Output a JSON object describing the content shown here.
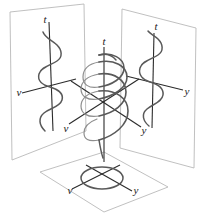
{
  "figure": {
    "background_color": "#ffffff",
    "plane_edge_color": "#b9b9b9",
    "curve_color": "#595959",
    "axis_color": "#2b2b2b",
    "label_color": "#1a1a1a",
    "width": 200,
    "height": 224
  },
  "planes": [
    {
      "id": "left-plane",
      "name": "v-t plane",
      "axes": {
        "vertical": "t",
        "horizontal": "v"
      },
      "projection": "sine-wave",
      "cycles": 2.5
    },
    {
      "id": "right-plane",
      "name": "y-t plane",
      "axes": {
        "vertical": "t",
        "horizontal": "y"
      },
      "projection": "sine-wave",
      "cycles": 2.5
    },
    {
      "id": "bottom-plane",
      "name": "v-y plane",
      "axes": {
        "first": "v",
        "second": "y"
      },
      "projection": "ellipse"
    }
  ],
  "center": {
    "id": "helix",
    "name": "3D helix",
    "axes": {
      "vertical": "t",
      "left": "v",
      "right": "y"
    },
    "turns": 2.5
  },
  "labels": {
    "left_plane_t": "t",
    "left_plane_v": "v",
    "right_plane_t": "t",
    "right_plane_y": "y",
    "center_t": "t",
    "center_v": "v",
    "center_y": "y",
    "bottom_v": "v",
    "bottom_y": "y"
  }
}
